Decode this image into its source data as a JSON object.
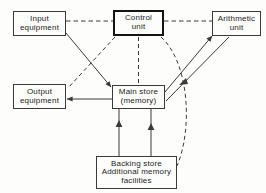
{
  "diagram": {
    "legend_note": "Solid lines: data flow. Dashed lines: control signals.",
    "colors": {
      "background": "#fdfdfc",
      "stroke": "#3a3a3a",
      "emphasis_stroke": "#141414",
      "text": "#1c1c1c"
    },
    "nodes": [
      {
        "id": "input-equipment",
        "lines": [
          "Input",
          "equipment"
        ],
        "emphasis": false
      },
      {
        "id": "control-unit",
        "lines": [
          "Control",
          "unit"
        ],
        "emphasis": true
      },
      {
        "id": "arithmetic-unit",
        "lines": [
          "Arithmetic",
          "unit"
        ],
        "emphasis": false
      },
      {
        "id": "output-equipment",
        "lines": [
          "Output",
          "equipment"
        ],
        "emphasis": false
      },
      {
        "id": "main-store",
        "lines": [
          "Main store",
          "(memory)"
        ],
        "emphasis": false
      },
      {
        "id": "backing-store",
        "lines": [
          "Backing store",
          "Additional memory",
          "facilities"
        ],
        "emphasis": false
      }
    ],
    "connections": [
      {
        "id": "input-to-control",
        "style": "dashed",
        "kind": "control",
        "from": "input-equipment",
        "to": "control-unit"
      },
      {
        "id": "control-to-arithmetic",
        "style": "dashed",
        "kind": "control",
        "from": "control-unit",
        "to": "arithmetic-unit"
      },
      {
        "id": "control-to-main-store",
        "style": "dashed",
        "kind": "control",
        "from": "control-unit",
        "to": "main-store"
      },
      {
        "id": "control-to-output",
        "style": "dashed",
        "kind": "control",
        "from": "control-unit",
        "to": "output-equipment"
      },
      {
        "id": "control-to-backing-store",
        "style": "dashed-curve",
        "kind": "control",
        "from": "control-unit",
        "to": "backing-store"
      },
      {
        "id": "input-to-main-store",
        "style": "solid",
        "kind": "data",
        "from": "input-equipment",
        "to": "main-store"
      },
      {
        "id": "main-store-to-output",
        "style": "solid",
        "kind": "data",
        "from": "main-store",
        "to": "output-equipment"
      },
      {
        "id": "main-store-to-arithmetic",
        "style": "solid",
        "kind": "data",
        "from": "main-store",
        "to": "arithmetic-unit"
      },
      {
        "id": "arithmetic-to-main-store",
        "style": "solid",
        "kind": "data",
        "from": "arithmetic-unit",
        "to": "main-store"
      },
      {
        "id": "backing-store-to-main-store-left",
        "style": "solid",
        "kind": "data",
        "from": "backing-store",
        "to": "main-store"
      },
      {
        "id": "backing-store-to-main-store-right",
        "style": "solid",
        "kind": "data",
        "from": "backing-store",
        "to": "main-store"
      }
    ]
  }
}
